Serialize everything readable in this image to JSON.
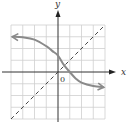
{
  "chart_data": {
    "type": "line",
    "title": "",
    "xlabel": "x",
    "ylabel": "y",
    "origin_label": "0",
    "xlim": [
      -4,
      4
    ],
    "ylim": [
      -4,
      4
    ],
    "grid": true,
    "grid_cells": 8,
    "series": [
      {
        "name": "curve",
        "style": "solid",
        "color": "#8a8a8a",
        "arrows": "both",
        "points": [
          [
            -3.9,
            3.0
          ],
          [
            -3,
            2.95
          ],
          [
            -2,
            2.75
          ],
          [
            -1,
            2.2
          ],
          [
            -0.5,
            1.8
          ],
          [
            0,
            1.4
          ],
          [
            0.5,
            0.6
          ],
          [
            1,
            0.0
          ],
          [
            1.5,
            -0.55
          ],
          [
            2,
            -0.9
          ],
          [
            3,
            -1.2
          ],
          [
            3.9,
            -1.3
          ]
        ]
      },
      {
        "name": "y = x",
        "style": "dashed",
        "color": "#444444",
        "points": [
          [
            -4,
            -4
          ],
          [
            4,
            4
          ]
        ]
      }
    ]
  },
  "colors": {
    "axis": "#333333",
    "grid": "#cfcfcf",
    "curve": "#8a8a8a",
    "dashed": "#444444"
  }
}
